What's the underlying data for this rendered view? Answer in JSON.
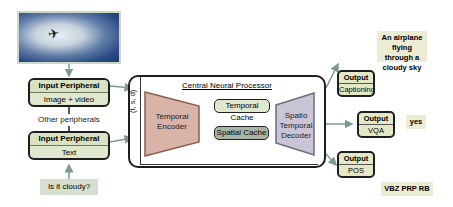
{
  "input_image": {
    "icon": "airplane-icon",
    "description": "airplane in cloudy sky"
  },
  "input_peripherals": [
    {
      "header": "Input Peripheral",
      "body": "Image + video"
    },
    {
      "header": "Input Peripheral",
      "body": "Text"
    }
  ],
  "other_peripherals_label": "Other peripherals",
  "query": "Is it cloudy?",
  "processor": {
    "title": "Central Neural Processor",
    "tsd_label": "(t, s, d)",
    "encoder": "Temporal Encoder",
    "temporal_cache": "Temporal Cache",
    "spatial_cache": "Spatial Cache",
    "decoder": "Spatio Temporal Decoder"
  },
  "outputs": [
    {
      "header": "Output",
      "body": "Captioning",
      "answer": "An airplane flying through a cloudy sky"
    },
    {
      "header": "Output",
      "body": "VQA",
      "answer": "yes"
    },
    {
      "header": "Output",
      "body": "POS",
      "answer": "VBZ PRP RB"
    }
  ],
  "colors": {
    "peripheral_fill": "#dfe8cf",
    "encoder_fill": "#d9b3a8",
    "decoder_fill": "#c9c5d6",
    "temporal_cache_fill": "#dfe8cf",
    "spatial_cache_fill": "#a8b5a4",
    "output_fill": "#e5e8c6",
    "arrow": "#7c9a93"
  }
}
